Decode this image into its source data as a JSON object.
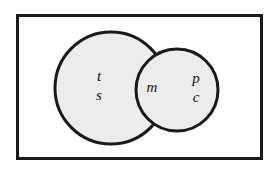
{
  "figure": {
    "type": "venn-diagram",
    "sets": 2,
    "universe_shape": "rectangle",
    "background_color": "#ffffff",
    "outline_color": "#1a1a1a",
    "circle_fill_color": "#ececec",
    "universe_fill_color": "#ffffff",
    "label_color": "#111111",
    "label_style": "italic-serif"
  },
  "universe": {
    "name": "universe-rectangle",
    "x": 17,
    "y": 15,
    "width": 244,
    "height": 143,
    "stroke_width": 3
  },
  "circles": [
    {
      "name": "left-circle",
      "cx": 111,
      "cy": 88,
      "r": 56,
      "stroke_width": 3
    },
    {
      "name": "right-circle",
      "cx": 177,
      "cy": 90,
      "r": 41,
      "stroke_width": 3
    }
  ],
  "labels": [
    {
      "id": "label-t",
      "text": "t",
      "region": "left-only",
      "x": 99,
      "y": 78
    },
    {
      "id": "label-s",
      "text": "s",
      "region": "left-only",
      "x": 99,
      "y": 97
    },
    {
      "id": "label-m",
      "text": "m",
      "region": "intersection",
      "x": 152,
      "y": 89
    },
    {
      "id": "label-p",
      "text": "p",
      "region": "right-only",
      "x": 196,
      "y": 80
    },
    {
      "id": "label-c",
      "text": "c",
      "region": "right-only",
      "x": 196,
      "y": 99
    }
  ]
}
